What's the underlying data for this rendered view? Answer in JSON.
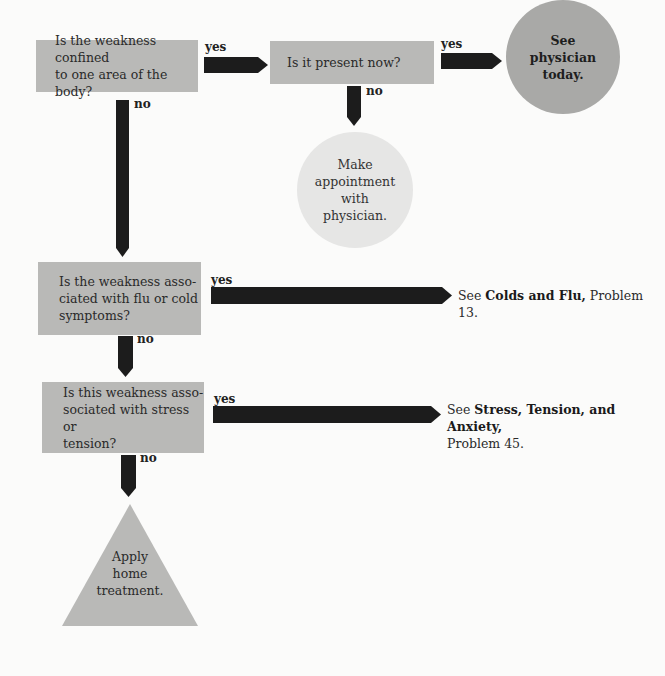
{
  "nodes": {
    "q1": {
      "lines": [
        "Is the weakness confined",
        "to one area of the body?"
      ]
    },
    "q2": {
      "lines": [
        "Is it present now?"
      ]
    },
    "q3": {
      "lines": [
        "Is the weakness asso-",
        "ciated with flu or cold",
        "symptoms?"
      ]
    },
    "q4": {
      "lines": [
        "Is this weakness asso-",
        "sociated with stress or",
        "tension?"
      ]
    },
    "urgent": {
      "lines": [
        "See",
        "physician",
        "today."
      ]
    },
    "appointment": {
      "lines": [
        "Make",
        "appointment",
        "with",
        "physician."
      ]
    },
    "home": {
      "lines": [
        "Apply",
        "home",
        "treatment."
      ]
    }
  },
  "labels": {
    "yes": "yes",
    "no": "no"
  },
  "refs": {
    "colds": {
      "prefix": "See ",
      "bold": "Colds and Flu,",
      "suffix": " Problem 13."
    },
    "stress": {
      "prefix": "See ",
      "bold": "Stress, Tension, and Anxiety,",
      "suffix": "Problem 45."
    }
  },
  "colors": {
    "box": "#b9b9b7",
    "arrow": "#1c1c1c",
    "urgent_circle": "#a9a9a7",
    "appointment_circle": "#e6e6e5"
  }
}
